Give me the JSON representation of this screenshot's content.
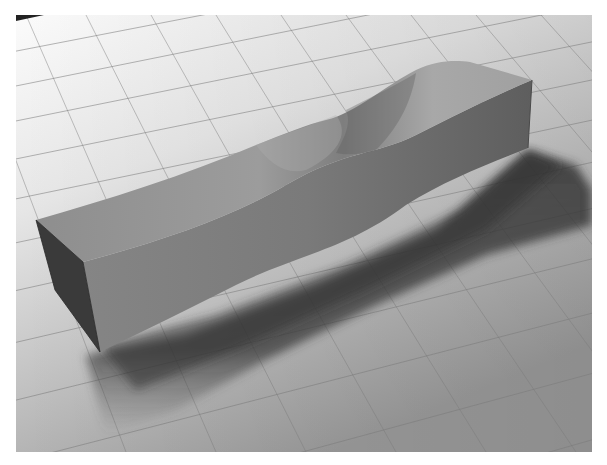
{
  "caption": {
    "text": "",
    "note": ""
  },
  "figure": {
    "colors": {
      "floor_light": "#f2f2f2",
      "floor_mid": "#b8b8b8",
      "floor_dark": "#8a8a8a",
      "grout": "#6e6e6e",
      "bench_top": "#9a9a9a",
      "bench_side": "#7a7a7a",
      "bench_end": "#3c3c3c",
      "shadow": "#4a4a4a"
    }
  }
}
